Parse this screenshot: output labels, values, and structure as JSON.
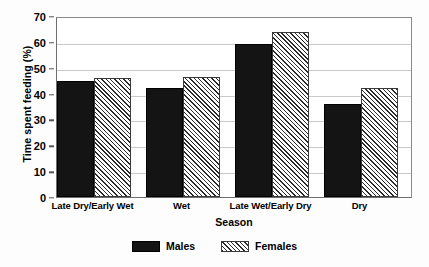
{
  "chart_data": {
    "type": "bar",
    "title": "",
    "xlabel": "Season",
    "ylabel": "Time spent feeding (%)",
    "categories": [
      "Late Dry/Early Wet",
      "Wet",
      "Late Wet/Early Dry",
      "Dry"
    ],
    "series": [
      {
        "name": "Males",
        "values": [
          45,
          42,
          59,
          36
        ],
        "color": "#141414",
        "fill": "solid"
      },
      {
        "name": "Females",
        "values": [
          46,
          46.5,
          64,
          42
        ],
        "color": "#2b2b2b",
        "fill": "diagonal-hatch"
      }
    ],
    "ylim": [
      0,
      70
    ],
    "yticks": [
      0,
      10,
      20,
      30,
      40,
      50,
      60,
      70
    ],
    "grid": "horizontal",
    "legend_position": "bottom-center"
  }
}
